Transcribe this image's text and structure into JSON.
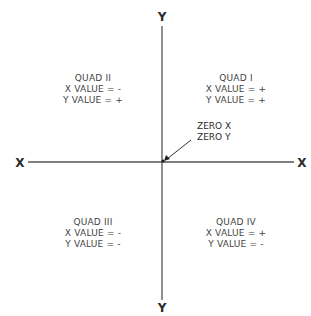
{
  "diagram": {
    "type": "cartesian-quadrants",
    "axes": {
      "y_top_label": "Y",
      "y_bottom_label": "Y",
      "x_left_label": "X",
      "x_right_label": "X",
      "line_color": "#555555"
    },
    "origin": {
      "line1": "ZERO X",
      "line2": "ZERO Y"
    },
    "quadrants": [
      {
        "id": "q1",
        "title": "QUAD I",
        "x_value": "X VALUE = +",
        "y_value": "Y VALUE = +"
      },
      {
        "id": "q2",
        "title": "QUAD II",
        "x_value": "X VALUE = -",
        "y_value": "Y VALUE = +"
      },
      {
        "id": "q3",
        "title": "QUAD III",
        "x_value": "X VALUE = -",
        "y_value": "Y VALUE = -"
      },
      {
        "id": "q4",
        "title": "QUAD IV",
        "x_value": "X VALUE = +",
        "y_value": "Y VALUE = -"
      }
    ]
  }
}
